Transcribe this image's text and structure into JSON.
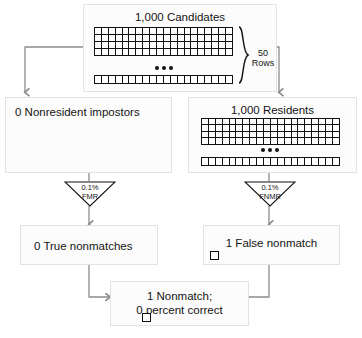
{
  "diagram": {
    "stroke_color": "#8c8c8c",
    "grid_color": "#111111",
    "box_fill": "#fcfcfc",
    "box_border": "#e2e2e2"
  },
  "nodes": {
    "candidates": {
      "label": "1,000 Candidates",
      "grid_columns": 20,
      "grid_rows_shown": 4,
      "tail_row_columns": 20,
      "ellipsis": "•••",
      "brace_label_line1": "50",
      "brace_label_line2": "Rows",
      "brace_label": "50 Rows"
    },
    "nonresident_impostors": {
      "label": "0 Nonresident impostors"
    },
    "residents": {
      "label": "1,000 Residents",
      "grid_columns": 20,
      "grid_rows_shown": 4,
      "tail_row_columns": 20,
      "ellipsis": "•••"
    },
    "true_nonmatches": {
      "label": "0 True nonmatches"
    },
    "false_nonmatch": {
      "label": "1 False nonmatch"
    },
    "total_nonmatch": {
      "label_line1": "1 Nonmatch;",
      "label_line2": "0 percent correct",
      "label": "1 Nonmatch; 0 percent correct"
    }
  },
  "funnels": {
    "fmr": {
      "rate": "0.1%",
      "metric": "FMR",
      "label": "0.1% FMR"
    },
    "fnmr": {
      "rate": "0.1%",
      "metric": "FNMR",
      "label": "0.1% FNMR"
    }
  },
  "markers": {
    "false_nonmatch_marker": "square-marker",
    "total_nonmatch_marker": "square-marker"
  }
}
